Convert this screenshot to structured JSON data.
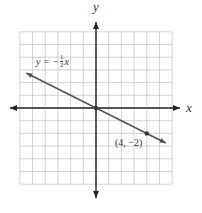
{
  "chart_data": {
    "type": "line",
    "title": "",
    "xlabel": "x",
    "ylabel": "y",
    "xlim": [
      -6,
      6
    ],
    "ylim": [
      -6,
      6
    ],
    "grid": true,
    "legend": null,
    "series": [
      {
        "name": "y = -1/2 x",
        "equation": "y = -(1/2)x",
        "slope": -0.5,
        "intercept": 0,
        "x": [
          -5.5,
          0,
          4,
          5.5
        ],
        "y": [
          2.75,
          0,
          -2,
          -2.75
        ]
      }
    ],
    "points": [
      {
        "x": 0,
        "y": 0,
        "label": ""
      },
      {
        "x": 4,
        "y": -2,
        "label": "(4, −2)"
      }
    ],
    "annotations": [
      {
        "text": "y = −½ x",
        "near": "upper-left of line"
      },
      {
        "text": "(4, −2)",
        "near": "point (4,-2)"
      }
    ]
  },
  "labels": {
    "x_axis": "x",
    "y_axis": "y",
    "equation_prefix": "y = −",
    "equation_frac_num": "1",
    "equation_frac_den": "2",
    "equation_suffix": "x",
    "point_label": "(4, −2)"
  }
}
